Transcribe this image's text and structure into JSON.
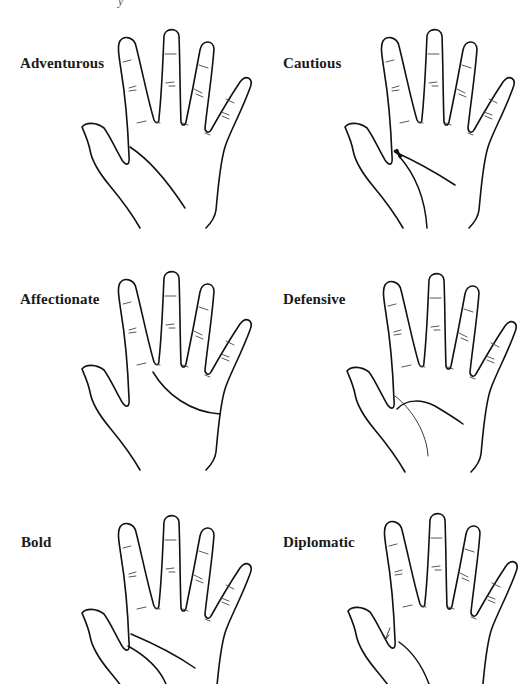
{
  "figure": {
    "title_fragment": "y",
    "panels": [
      {
        "id": "adventurous",
        "label": "Adventurous",
        "position": "row-1-left",
        "palm_lines": [
          "life-line-wide-from-thumb-web"
        ]
      },
      {
        "id": "cautious",
        "label": "Cautious",
        "position": "row-1-right",
        "palm_lines": [
          "head-line-joined-to-life-line-with-knot",
          "life-line"
        ]
      },
      {
        "id": "affectionate",
        "label": "Affectionate",
        "position": "row-2-left",
        "palm_lines": [
          "heart-line-curving-to-edge"
        ]
      },
      {
        "id": "defensive",
        "label": "Defensive",
        "position": "row-2-right",
        "palm_lines": [
          "head-line-inside-life-line",
          "thin-life-line"
        ]
      },
      {
        "id": "bold",
        "label": "Bold",
        "position": "row-3-left",
        "palm_lines": [
          "head-line-separate-from-life-line",
          "life-line"
        ]
      },
      {
        "id": "diplomatic",
        "label": "Diplomatic",
        "position": "row-3-right",
        "palm_lines": [
          "thumb-angle-arrow",
          "life-line"
        ]
      }
    ],
    "colors": {
      "ink": "#111111",
      "background": "#ffffff",
      "label": "#1a1a1a"
    }
  }
}
